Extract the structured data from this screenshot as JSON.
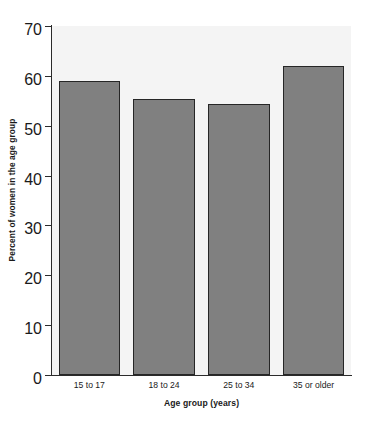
{
  "chart_data": {
    "type": "bar",
    "title": "",
    "subtitle": "",
    "xlabel": "Age group (years)",
    "ylabel": "Percent of women in the age group",
    "categories": [
      "15 to 17",
      "18 to 24",
      "25 to 34",
      "35 or older"
    ],
    "values": [
      59,
      55.3,
      54.3,
      62
    ],
    "ylim": [
      0,
      70
    ],
    "yticks": [
      0,
      10,
      20,
      30,
      40,
      50,
      60,
      70
    ],
    "ytick_labels": [
      "0",
      "10",
      "20",
      "30",
      "40",
      "50",
      "60",
      "70"
    ],
    "grid": false,
    "legend": null,
    "legend_position": "none",
    "annotations": [],
    "series": [
      {
        "name": "Percent of women in the age group",
        "values": [
          59,
          55.3,
          54.3,
          62
        ]
      }
    ],
    "colors": {
      "bar_fill": "#808080",
      "bar_edge": "#262626",
      "plot_background": "#f4f4f4",
      "figure_background": "#ffffff",
      "axis_line": "#2b2b2b",
      "text": "#1a1a1a"
    }
  }
}
